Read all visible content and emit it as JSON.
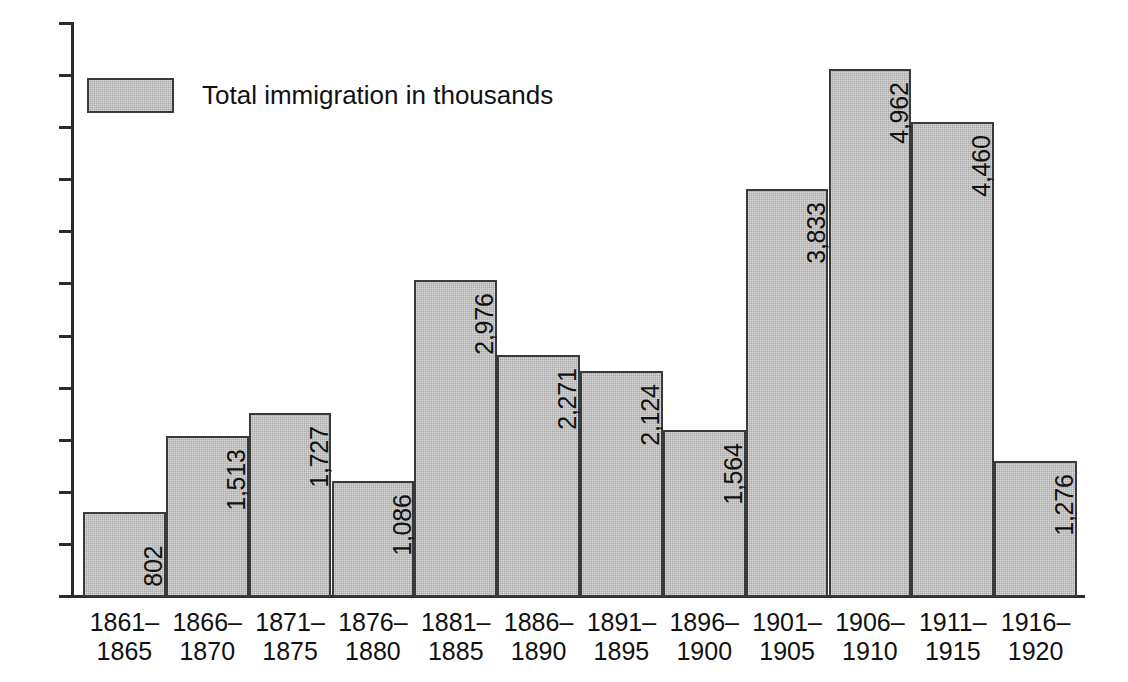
{
  "chart_data": {
    "type": "bar",
    "title": "",
    "subtitle": "",
    "xlabel": "",
    "ylabel": "",
    "ylim": [
      0,
      5400
    ],
    "grid": false,
    "legend_position": "top-left",
    "axis_tick_labels": [],
    "y_tick_count": 12,
    "categories": [
      "1861–1865",
      "1866–1870",
      "1871–1875",
      "1876–1880",
      "1881–1885",
      "1886–1890",
      "1891–1895",
      "1896–1900",
      "1901–1905",
      "1906–1910",
      "1911–1915",
      "1916–1920"
    ],
    "category_lines": [
      [
        "1861–",
        "1865"
      ],
      [
        "1866–",
        "1870"
      ],
      [
        "1871–",
        "1875"
      ],
      [
        "1876–",
        "1880"
      ],
      [
        "1881–",
        "1885"
      ],
      [
        "1886–",
        "1890"
      ],
      [
        "1891–",
        "1895"
      ],
      [
        "1896–",
        "1900"
      ],
      [
        "1901–",
        "1905"
      ],
      [
        "1906–",
        "1910"
      ],
      [
        "1911–",
        "1915"
      ],
      [
        "1916–",
        "1920"
      ]
    ],
    "values": [
      802,
      1513,
      1727,
      1086,
      2976,
      2271,
      2124,
      1564,
      3833,
      4962,
      4460,
      1276
    ],
    "value_labels": [
      "802",
      "1,513",
      "1,727",
      "1,086",
      "2,976",
      "2,271",
      "2,124",
      "1,564",
      "3,833",
      "4,962",
      "4,460",
      "1,276"
    ],
    "series": [
      {
        "name": "Total immigration in thousands",
        "values": [
          802,
          1513,
          1727,
          1086,
          2976,
          2271,
          2124,
          1564,
          3833,
          4962,
          4460,
          1276
        ]
      }
    ],
    "colors": {
      "bar_fill": "#a9a9a9",
      "bar_border": "#3a3a3a",
      "axis": "#2b2b2b",
      "text": "#111111",
      "background": "#ffffff"
    }
  },
  "legend": {
    "label": "Total immigration in thousands"
  }
}
